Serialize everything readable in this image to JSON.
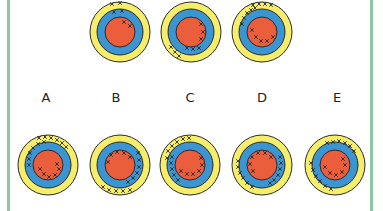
{
  "colors": {
    "outer_ring": "#f6ee6a",
    "middle_ring": "#3b95d2",
    "inner_disc": "#ea5e3c",
    "outline": "#2a2a2a",
    "cross": "#2a2a2a",
    "side_bar": "#8cc9a0"
  },
  "question_sequence": [
    {
      "id": "q1",
      "cx": 120,
      "cy": 32,
      "crosses": {
        "outer": [
          [
            -8,
            -28
          ],
          [
            0,
            -29
          ]
        ],
        "middle": [
          [
            -6,
            -20
          ],
          [
            2,
            -21
          ]
        ],
        "inner": [
          [
            4,
            -10
          ],
          [
            10,
            -6
          ]
        ]
      }
    },
    {
      "id": "q2",
      "cx": 191,
      "cy": 32,
      "crosses": {
        "outer": [
          [
            -20,
            15
          ],
          [
            -16,
            20
          ],
          [
            -12,
            24
          ]
        ],
        "middle": [
          [
            -4,
            16
          ],
          [
            2,
            17
          ],
          [
            8,
            16
          ]
        ],
        "inner": [
          [
            10,
            -8
          ],
          [
            12,
            0
          ],
          [
            10,
            7
          ]
        ]
      }
    },
    {
      "id": "q3",
      "cx": 262,
      "cy": 32,
      "crosses": {
        "outer": [
          [
            -9,
            -27
          ],
          [
            -3,
            -28
          ],
          [
            3,
            -28
          ],
          [
            9,
            -27
          ]
        ],
        "middle": [
          [
            -18,
            -14
          ],
          [
            -15,
            -19
          ],
          [
            -11,
            -22
          ],
          [
            -7,
            -24
          ],
          [
            -20,
            -8
          ]
        ],
        "inner": [
          [
            -10,
            -2
          ],
          [
            -6,
            5
          ],
          [
            -1,
            9
          ],
          [
            5,
            9
          ],
          [
            11,
            5
          ]
        ]
      }
    }
  ],
  "labels": [
    {
      "text": "A",
      "x": 46
    },
    {
      "text": "B",
      "x": 116
    },
    {
      "text": "C",
      "x": 190
    },
    {
      "text": "D",
      "x": 262
    },
    {
      "text": "E",
      "x": 337
    }
  ],
  "options": [
    {
      "id": "A",
      "cx": 48,
      "cy": 165,
      "crosses": {
        "outer": [
          [
            -3,
            -28
          ],
          [
            3,
            -27
          ],
          [
            9,
            -25
          ],
          [
            14,
            -22
          ],
          [
            18,
            -18
          ],
          [
            -9,
            -27
          ]
        ],
        "middle": [
          [
            -10,
            -21
          ],
          [
            -15,
            -17
          ],
          [
            -18,
            -12
          ],
          [
            -19,
            -6
          ],
          [
            -19,
            0
          ],
          [
            -4,
            -23
          ]
        ],
        "inner": [
          [
            -8,
            4
          ],
          [
            -4,
            9
          ],
          [
            1,
            12
          ],
          [
            7,
            10
          ],
          [
            11,
            4
          ],
          [
            9,
            -1
          ]
        ]
      }
    },
    {
      "id": "B",
      "cx": 120,
      "cy": 165,
      "crosses": {
        "outer": [
          [
            -17,
            22
          ],
          [
            -11,
            25
          ],
          [
            -4,
            26
          ],
          [
            3,
            26
          ],
          [
            10,
            25
          ]
        ],
        "middle": [
          [
            18,
            -12
          ],
          [
            19,
            -5
          ],
          [
            19,
            2
          ],
          [
            17,
            8
          ],
          [
            13,
            13
          ],
          [
            8,
            17
          ]
        ],
        "inner": [
          [
            -12,
            -3
          ],
          [
            -9,
            -10
          ],
          [
            -3,
            -13
          ],
          [
            4,
            -12
          ],
          [
            10,
            -8
          ]
        ]
      }
    },
    {
      "id": "C",
      "cx": 190,
      "cy": 165,
      "crosses": {
        "outer": [
          [
            -22,
            -14
          ],
          [
            -18,
            -19
          ],
          [
            -13,
            -23
          ],
          [
            -7,
            -26
          ],
          [
            -1,
            -27
          ],
          [
            -23,
            -7
          ]
        ],
        "middle": [
          [
            -18,
            -8
          ],
          [
            -19,
            -2
          ],
          [
            -18,
            4
          ],
          [
            -16,
            10
          ],
          [
            -12,
            15
          ]
        ],
        "inner": [
          [
            11,
            -7
          ],
          [
            12,
            0
          ],
          [
            9,
            6
          ],
          [
            3,
            9
          ],
          [
            -3,
            9
          ],
          [
            -9,
            6
          ]
        ]
      }
    },
    {
      "id": "D",
      "cx": 262,
      "cy": 165,
      "crosses": {
        "outer": [
          [
            -24,
            -4
          ],
          [
            -24,
            2
          ],
          [
            -22,
            8
          ],
          [
            -19,
            13
          ],
          [
            -15,
            18
          ],
          [
            -10,
            22
          ]
        ],
        "middle": [
          [
            18,
            -8
          ],
          [
            19,
            -2
          ],
          [
            18,
            4
          ],
          [
            16,
            10
          ],
          [
            12,
            15
          ],
          [
            8,
            18
          ]
        ],
        "inner": [
          [
            -10,
            -8
          ],
          [
            -4,
            -12
          ],
          [
            3,
            -12
          ],
          [
            9,
            -8
          ],
          [
            -12,
            -1
          ],
          [
            -9,
            6
          ]
        ]
      }
    },
    {
      "id": "E",
      "cx": 335,
      "cy": 165,
      "crosses": {
        "outer": [
          [
            -24,
            -2
          ],
          [
            -22,
            5
          ],
          [
            -19,
            11
          ],
          [
            -15,
            16
          ],
          [
            -10,
            21
          ],
          [
            -4,
            24
          ]
        ],
        "middle": [
          [
            -2,
            -23
          ],
          [
            4,
            -24
          ],
          [
            10,
            -22
          ],
          [
            15,
            -19
          ],
          [
            19,
            -14
          ],
          [
            -8,
            -22
          ]
        ],
        "inner": [
          [
            8,
            -6
          ],
          [
            10,
            0
          ],
          [
            7,
            7
          ],
          [
            1,
            10
          ],
          [
            -5,
            8
          ],
          [
            -10,
            2
          ]
        ]
      }
    }
  ]
}
